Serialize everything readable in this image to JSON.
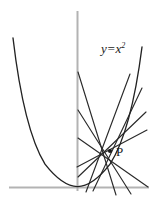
{
  "figure": {
    "labels": {
      "curve_equation_lhs": "y=x",
      "curve_equation_exponent": "2",
      "point_label": "P"
    },
    "colors": {
      "curve": "#222222",
      "lines": "#2a2a2a",
      "axes": "#b3b3b3",
      "background": "#ffffff",
      "text": "#1a1a1a"
    },
    "axes": {
      "x_axis": {
        "y": 187,
        "x_start": 9,
        "x_end": 149,
        "color": "#b3b3b3"
      },
      "y_axis": {
        "x": 77.5,
        "y_start": 11,
        "y_end": 191,
        "color": "#b3b3b3"
      }
    },
    "parabola": {
      "vertex": {
        "x": 77.5,
        "y": 186.5
      },
      "left_endpoint": {
        "x": 13,
        "y": 38
      },
      "right_endpoint": {
        "x": 142,
        "y": 47
      },
      "curvature_note": "y = x^2 opening upward, vertex tangent to x-axis"
    },
    "point_p": {
      "x": 110,
      "y": 151
    },
    "fan_lines": [
      {
        "id": "line-1",
        "x1": 78,
        "y1": 72,
        "x2": 116,
        "y2": 195
      },
      {
        "id": "line-2",
        "x1": 78,
        "y1": 110,
        "x2": 131,
        "y2": 194
      },
      {
        "id": "line-3",
        "x1": 130,
        "y1": 74,
        "x2": 86,
        "y2": 192
      },
      {
        "id": "line-4",
        "x1": 142,
        "y1": 88,
        "x2": 93,
        "y2": 191
      },
      {
        "id": "line-5",
        "x1": 146,
        "y1": 112,
        "x2": 78,
        "y2": 177
      },
      {
        "id": "line-6",
        "x1": 147,
        "y1": 130,
        "x2": 77,
        "y2": 167
      },
      {
        "id": "line-7",
        "x1": 148,
        "y1": 187,
        "x2": 78,
        "y2": 138
      }
    ]
  }
}
